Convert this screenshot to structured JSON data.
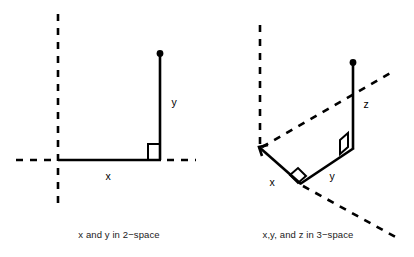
{
  "figure": {
    "background_color": "#ffffff",
    "line_color": "#000000",
    "panels": [
      {
        "id": "two-space",
        "caption": "x and y in 2−space",
        "labels": {
          "horizontal": "x",
          "vertical": "y"
        },
        "description": "A horizontal segment x from the origin to the right, then a vertical segment y upward ending in a filled dot, with a right-angle square marker at their junction; dashed coordinate axes cross at the origin."
      },
      {
        "id": "three-space",
        "caption": "x,y, and z in 3−space",
        "labels": {
          "depth": "x",
          "horizontal": "y",
          "vertical": "z"
        },
        "description": "A receding segment x, a segment y, and a vertical segment z ending in a filled dot, with parallelogram right-angle markers at the two junctions; dashed axes extend from the origin."
      }
    ]
  }
}
